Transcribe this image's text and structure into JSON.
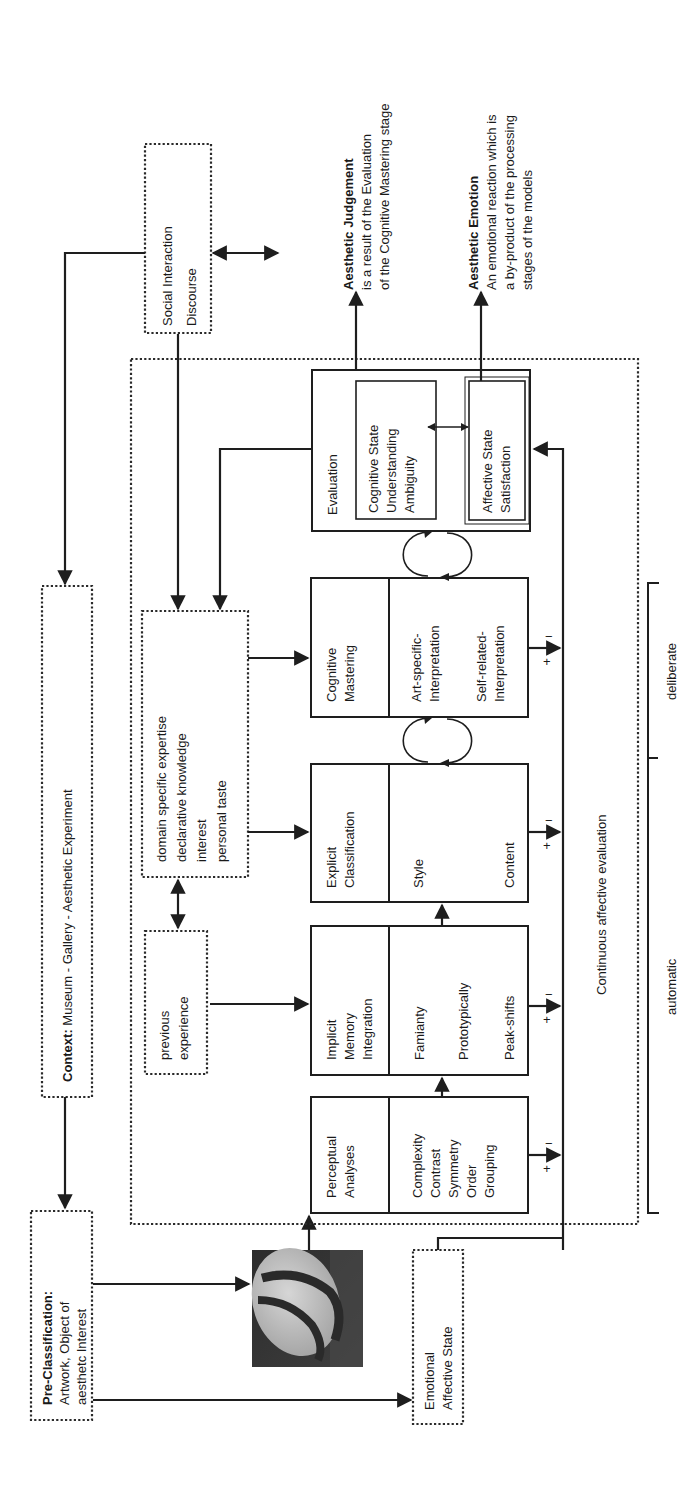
{
  "diagram": {
    "orientation": "rotated-90-ccw",
    "context_box": {
      "label_bold": "Context:",
      "label": " Museum - Gallery - Aesthetic Experiment"
    },
    "pre_classification": {
      "title": "Pre-Classification:",
      "lines": [
        "Artwork, Object of",
        "aesthetc Interest"
      ]
    },
    "artwork_image": {
      "description": "artwork thumbnail (dark image with pale oval crossed by dark diagonal bands)"
    },
    "emotional_state": {
      "lines": [
        "Emotional",
        "Affective State"
      ]
    },
    "social_box": {
      "lines": [
        "Social Interaction",
        "Discourse"
      ]
    },
    "previous_experience": {
      "lines": [
        "previous",
        "experience"
      ]
    },
    "domain_box": {
      "lines": [
        "domain specific expertise",
        "declarative knowledge",
        "interest",
        "personal taste"
      ]
    },
    "stages": [
      {
        "id": "perceptual",
        "title": [
          "Perceptual",
          "Analyses"
        ],
        "items": [
          "Complexity",
          "Contrast",
          "Symmetry",
          "Order",
          "Grouping"
        ]
      },
      {
        "id": "implicit",
        "title": [
          "Implicit",
          "Memory",
          "Integration"
        ],
        "items": [
          "Famianty",
          "Prototypically",
          "Peak-shifts"
        ]
      },
      {
        "id": "explicit",
        "title": [
          "Explicit",
          "Classification"
        ],
        "items": [
          "Style",
          "Content"
        ]
      },
      {
        "id": "cognitive",
        "title": [
          "Cognitive",
          "Mastering"
        ],
        "items": [
          "Art-specific-",
          "Interpretation",
          "Self-related-",
          "Interpretation"
        ]
      },
      {
        "id": "evaluation",
        "title": [
          "Evaluation"
        ],
        "cognitive_state": [
          "Cognitive State",
          "Understanding",
          "Ambiguity"
        ],
        "affective_state": [
          "Affective State",
          "Satisfaction"
        ]
      }
    ],
    "feedback_signs": {
      "plus": "+",
      "minus": "−"
    },
    "continuous_label": "Continuous affective evaluation",
    "bracket": {
      "upper": "deliberate",
      "lower": "automatic"
    },
    "outputs": {
      "judgement": {
        "title": "Aesthetic Judgement",
        "lines": [
          "is a result of the Evaluation",
          "of the Cognitive Mastering stage"
        ]
      },
      "emotion": {
        "title": "Aesthetic Emotion",
        "lines": [
          "An emotional reaction which is",
          "a by-product of the processing",
          "stages of the models"
        ]
      }
    },
    "colors": {
      "ink": "#1e1e1e",
      "background": "#ffffff"
    }
  }
}
